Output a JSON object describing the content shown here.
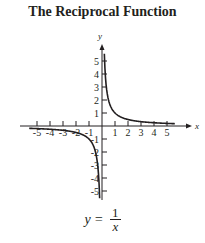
{
  "title": "The Reciprocal Function",
  "formula": {
    "lhs": "y =",
    "numerator": "1",
    "denominator": "x"
  },
  "chart_data": {
    "type": "line",
    "title": "The Reciprocal Function",
    "function": "y = 1/x",
    "xlabel": "x",
    "ylabel": "y",
    "xlim": [
      -5.5,
      5.5
    ],
    "ylim": [
      -5.5,
      5.5
    ],
    "x_ticks": [
      -5,
      -4,
      -3,
      -2,
      -1,
      1,
      2,
      3,
      4,
      5
    ],
    "y_ticks": [
      -5,
      -4,
      -3,
      -2,
      -1,
      1,
      2,
      3,
      4,
      5
    ],
    "x_tick_labels": [
      "-5",
      "-4",
      "-3",
      "-2",
      "-1",
      "1",
      "2",
      "3",
      "4",
      "5"
    ],
    "y_tick_labels": [
      "-5",
      "-4",
      "-3",
      "-2",
      "-1",
      "1",
      "2",
      "3",
      "4",
      "5"
    ],
    "grid": false,
    "series": [
      {
        "name": "y = 1/x (x > 0)",
        "x": [
          0.18,
          0.25,
          0.5,
          1,
          2,
          3,
          4,
          5,
          5.5
        ],
        "y": [
          5.5,
          4,
          2,
          1,
          0.5,
          0.333,
          0.25,
          0.2,
          0.18
        ]
      },
      {
        "name": "y = 1/x (x < 0)",
        "x": [
          -5.5,
          -5,
          -4,
          -3,
          -2,
          -1,
          -0.5,
          -0.25,
          -0.18
        ],
        "y": [
          -0.18,
          -0.2,
          -0.25,
          -0.333,
          -0.5,
          -1,
          -2,
          -4,
          -5.5
        ]
      }
    ],
    "colors": {
      "curve": "#231f20",
      "axes": "#231f20"
    }
  }
}
